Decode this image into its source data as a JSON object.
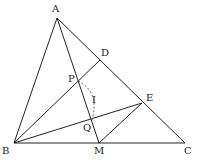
{
  "diagram": {
    "type": "geometry-figure",
    "points": {
      "A": "A",
      "B": "B",
      "C": "C",
      "D": "D",
      "E": "E",
      "M": "M",
      "P": "P",
      "Q": "Q"
    },
    "arc_label": "I",
    "segments": [
      "AB",
      "BC",
      "CA",
      "AM",
      "BD",
      "BE",
      "ME"
    ],
    "line_color": "#222222"
  }
}
